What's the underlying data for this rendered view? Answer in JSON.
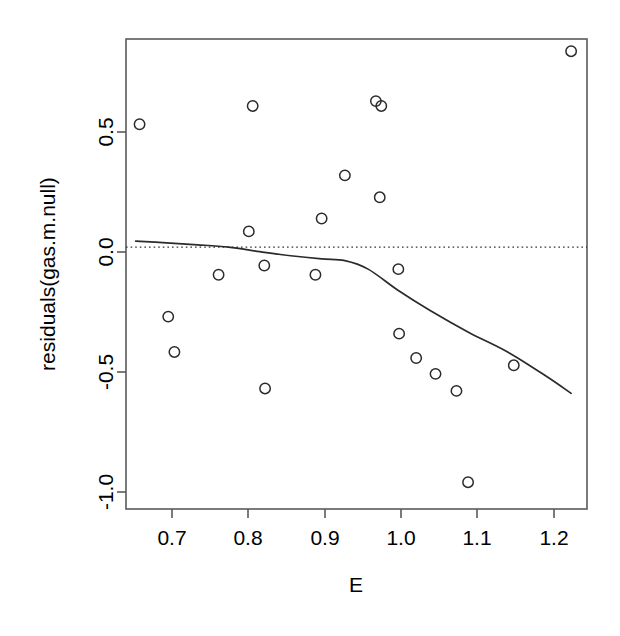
{
  "chart_data": {
    "type": "scatter",
    "title": "",
    "xlabel": "E",
    "ylabel": "residuals(gas.m.null)",
    "xlim": [
      0.6475,
      1.2425
    ],
    "ylim": [
      -1.075,
      0.855
    ],
    "grid": false,
    "legend": "none",
    "xticks": [
      0.7,
      0.8,
      0.9,
      1.0,
      1.1,
      1.2
    ],
    "xticklabels": [
      "0.7",
      "0.8",
      "0.9",
      "1.0",
      "1.1",
      "1.2"
    ],
    "yticks": [
      0.5,
      0.0,
      -0.5,
      -1.0
    ],
    "yticklabels": [
      "0.5",
      "0.0",
      "-0.5",
      "-1.0"
    ],
    "point_marker": "open-circle",
    "point_color": "#2b2b2b",
    "points": [
      {
        "x": 0.665,
        "y": 0.505
      },
      {
        "x": 0.702,
        "y": -0.285
      },
      {
        "x": 0.71,
        "y": -0.43
      },
      {
        "x": 0.767,
        "y": -0.113
      },
      {
        "x": 0.806,
        "y": 0.065
      },
      {
        "x": 0.811,
        "y": 0.58
      },
      {
        "x": 0.826,
        "y": -0.075
      },
      {
        "x": 0.827,
        "y": -0.58
      },
      {
        "x": 0.892,
        "y": -0.113
      },
      {
        "x": 0.9,
        "y": 0.118
      },
      {
        "x": 0.93,
        "y": 0.295
      },
      {
        "x": 0.97,
        "y": 0.6
      },
      {
        "x": 0.977,
        "y": 0.58
      },
      {
        "x": 0.975,
        "y": 0.205
      },
      {
        "x": 0.999,
        "y": -0.09
      },
      {
        "x": 1.0,
        "y": -0.355
      },
      {
        "x": 1.022,
        "y": -0.455
      },
      {
        "x": 1.047,
        "y": -0.52
      },
      {
        "x": 1.074,
        "y": -0.59
      },
      {
        "x": 1.089,
        "y": -0.965
      },
      {
        "x": 1.148,
        "y": -0.485
      },
      {
        "x": 1.222,
        "y": 0.805
      }
    ],
    "reference_line": {
      "type": "horizontal",
      "y": 0.0,
      "style": "dotted"
    },
    "smooth_curve": {
      "name": "lowess",
      "style": "solid",
      "x": [
        0.66,
        0.7,
        0.74,
        0.78,
        0.82,
        0.86,
        0.9,
        0.93,
        0.96,
        1.0,
        1.04,
        1.09,
        1.14,
        1.19,
        1.222
      ],
      "y": [
        0.025,
        0.018,
        0.01,
        0.0,
        -0.018,
        -0.035,
        -0.048,
        -0.055,
        -0.09,
        -0.18,
        -0.26,
        -0.35,
        -0.43,
        -0.53,
        -0.6
      ]
    }
  },
  "axes_geometry": {
    "plot_left_px": 126,
    "plot_right_px": 587,
    "plot_top_px": 39,
    "plot_bottom_px": 509
  }
}
